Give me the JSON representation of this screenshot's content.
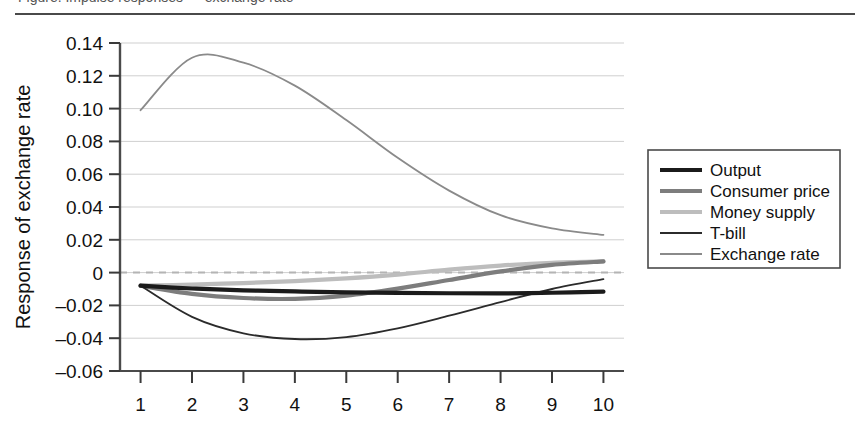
{
  "figure": {
    "partial_caption_top": "Figure. Impulse responses — exchange rate",
    "background_color": "#ffffff"
  },
  "chart_data": {
    "type": "line",
    "title": "",
    "xlabel": "",
    "ylabel": "Response of exchange rate",
    "x": [
      1,
      2,
      3,
      4,
      5,
      6,
      7,
      8,
      9,
      10
    ],
    "xlim": [
      0.6,
      10.4
    ],
    "ylim": [
      -0.06,
      0.14
    ],
    "yticks": [
      0.14,
      0.12,
      0.1,
      0.08,
      0.06,
      0.04,
      0.02,
      0,
      -0.02,
      -0.04,
      -0.06
    ],
    "ytick_labels": [
      "0.14",
      "0.12",
      "0.10",
      "0.08",
      "0.06",
      "0.04",
      "0.02",
      "0",
      "–0.02",
      "–0.04",
      "–0.06"
    ],
    "xticks": [
      1,
      2,
      3,
      4,
      5,
      6,
      7,
      8,
      9,
      10
    ],
    "xtick_labels": [
      "1",
      "2",
      "3",
      "4",
      "5",
      "6",
      "7",
      "8",
      "9",
      "10"
    ],
    "grid": "horizontal",
    "zero_line": {
      "value": 0,
      "style": "dashed",
      "color": "#b4b4b4"
    },
    "legend_position": "right-outside",
    "series": [
      {
        "name": "Output",
        "color": "#1b1b1b",
        "width": 4.2,
        "values": [
          -0.008,
          -0.0097,
          -0.0108,
          -0.0115,
          -0.012,
          -0.0124,
          -0.0126,
          -0.0127,
          -0.0123,
          -0.0116
        ]
      },
      {
        "name": "Consumer price",
        "color": "#7d7d7d",
        "width": 4.2,
        "values": [
          -0.008,
          -0.013,
          -0.0155,
          -0.016,
          -0.014,
          -0.0098,
          -0.0045,
          0.0007,
          0.0047,
          0.0068
        ]
      },
      {
        "name": "Money supply",
        "color": "#bdbdbd",
        "width": 4.2,
        "values": [
          -0.008,
          -0.0073,
          -0.0064,
          -0.0052,
          -0.0035,
          -0.0012,
          0.0018,
          0.0043,
          0.006,
          0.0068
        ]
      },
      {
        "name": "T-bill",
        "color": "#2b2b2b",
        "width": 1.8,
        "values": [
          -0.008,
          -0.027,
          -0.037,
          -0.0405,
          -0.0393,
          -0.034,
          -0.0263,
          -0.018,
          -0.01,
          -0.004
        ]
      },
      {
        "name": "Exchange rate",
        "color": "#8a8a8a",
        "width": 1.8,
        "values": [
          0.099,
          0.131,
          0.128,
          0.114,
          0.093,
          0.07,
          0.05,
          0.035,
          0.027,
          0.023
        ]
      }
    ]
  },
  "legend": {
    "items": [
      {
        "label": "Output"
      },
      {
        "label": "Consumer price"
      },
      {
        "label": "Money supply"
      },
      {
        "label": "T-bill"
      },
      {
        "label": "Exchange rate"
      }
    ]
  }
}
